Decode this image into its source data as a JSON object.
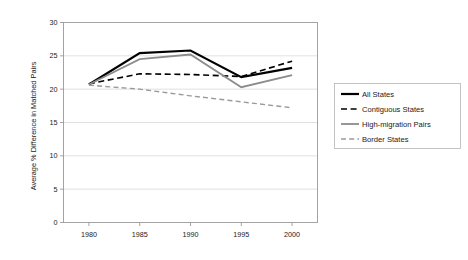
{
  "chart_data": {
    "type": "line",
    "title": "",
    "xlabel": "",
    "ylabel": "Average % Difference in Matched Pairs",
    "x": [
      1980,
      1985,
      1990,
      1995,
      2000
    ],
    "xtick_labels": [
      "1980",
      "1985",
      "1990",
      "1995",
      "2000"
    ],
    "ytick_labels": [
      "0",
      "5",
      "10",
      "15",
      "20",
      "25",
      "30"
    ],
    "yticks": [
      0,
      5,
      10,
      15,
      20,
      25,
      30
    ],
    "ylim": [
      0,
      30
    ],
    "xlim": [
      1977.5,
      2002.5
    ],
    "grid": "horizontal",
    "legend_position": "right",
    "series": [
      {
        "name": "All States",
        "values": [
          20.7,
          25.4,
          25.8,
          21.8,
          23.2
        ],
        "color": "#000000",
        "style": "solid",
        "width": 2.2
      },
      {
        "name": "Contiguous States",
        "values": [
          20.8,
          22.3,
          22.2,
          21.9,
          24.2
        ],
        "color": "#000000",
        "style": "dashed",
        "width": 1.6
      },
      {
        "name": "High-migration Pairs",
        "values": [
          20.7,
          24.5,
          25.2,
          20.3,
          22.1
        ],
        "color": "#8c8c8c",
        "style": "solid",
        "width": 1.8
      },
      {
        "name": "Border States",
        "values": [
          20.6,
          20.0,
          19.0,
          18.1,
          17.2
        ],
        "color": "#9a9a9a",
        "style": "dashed",
        "width": 1.4
      }
    ]
  },
  "legend": {
    "entries": [
      {
        "label": "All States"
      },
      {
        "label": "Contiguous States"
      },
      {
        "label": "High-migration Pairs"
      },
      {
        "label": "Border States"
      }
    ]
  }
}
